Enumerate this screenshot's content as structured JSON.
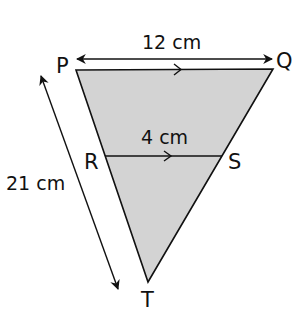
{
  "diagram": {
    "type": "similar-triangles",
    "colors": {
      "fill": "#d3d3d3",
      "stroke": "#111111",
      "background": "#ffffff"
    },
    "vertices": {
      "P": "P",
      "Q": "Q",
      "R": "R",
      "S": "S",
      "T": "T"
    },
    "measurements": {
      "PQ": "12 cm",
      "RS": "4 cm",
      "PT": "21 cm"
    },
    "annotations": {
      "parallel_marks": [
        "PQ",
        "RS"
      ]
    }
  }
}
